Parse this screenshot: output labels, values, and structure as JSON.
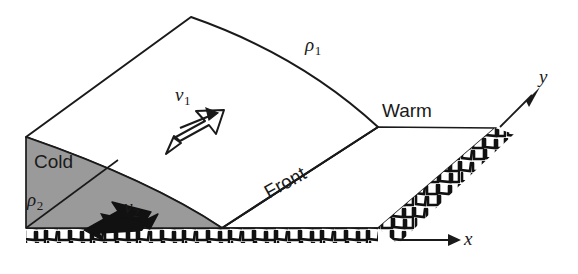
{
  "figure": {
    "type": "diagram",
    "colors": {
      "cold_air_fill": "#9a9a9a",
      "warm_air_fill": "#ffffff",
      "ground_fill": "#ffffff",
      "line": "#1a1a1a",
      "background": "#ffffff"
    }
  },
  "labels": {
    "density_warm": "ρ",
    "density_warm_sub": "1",
    "density_cold": "ρ",
    "density_cold_sub": "2",
    "velocity_warm": "v",
    "velocity_warm_sub": "1",
    "velocity_cold": "v",
    "velocity_cold_sub": "2",
    "air_mass_warm": "Warm",
    "air_mass_cold": "Cold",
    "boundary": "Front",
    "axis_x": "x",
    "axis_y": "y"
  },
  "arrows": {
    "warm_flow": {
      "name": "v1-arrow",
      "style": "hollow-outline",
      "direction": "up-right",
      "angle_deg": -27
    },
    "cold_flow": {
      "name": "v2-arrow",
      "style": "solid-black",
      "direction": "down-left",
      "angle_deg": 200
    },
    "axis_x_arrow": {
      "name": "x-axis-arrow",
      "style": "solid-line",
      "direction": "right"
    },
    "axis_y_arrow": {
      "name": "y-axis-arrow",
      "style": "solid-line",
      "direction": "up-right"
    }
  },
  "regions": {
    "cold_wedge": "gray shaded triangular cold air mass at lower left",
    "frontal_surface": "curved white sloping interface between cold and warm air",
    "ground_plane": "cobblestone textured horizontal surface"
  }
}
